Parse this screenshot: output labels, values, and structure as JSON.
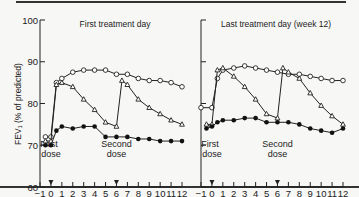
{
  "chart_data": [
    {
      "type": "line",
      "title": "First treatment day",
      "xlabel": "Hours",
      "ylabel": "FEV1 (% of predicted)",
      "xlim": [
        -1,
        12
      ],
      "ylim": [
        60,
        100
      ],
      "xticks": [
        -1,
        0,
        1,
        2,
        3,
        4,
        5,
        6,
        7,
        8,
        9,
        10,
        11,
        12
      ],
      "yticks": [
        60,
        70,
        80,
        90,
        100
      ],
      "annotations": [
        {
          "text": "First dose",
          "x": 0
        },
        {
          "text": "Second dose",
          "x": 6
        }
      ],
      "series": [
        {
          "name": "open-circle",
          "marker": "open-circle",
          "x": [
            -0.5,
            0,
            0.5,
            1,
            2,
            3,
            4,
            5,
            6,
            7,
            8,
            9,
            10,
            11,
            12
          ],
          "values": [
            72,
            72,
            85,
            86,
            87.5,
            88,
            88,
            88,
            87,
            87,
            86,
            85.5,
            85.5,
            85,
            84
          ]
        },
        {
          "name": "open-triangle",
          "marker": "open-triangle",
          "x": [
            -0.5,
            0,
            0.5,
            1,
            2,
            3,
            4,
            5,
            6,
            6.5,
            7,
            8,
            9,
            10,
            11,
            12
          ],
          "values": [
            71,
            71,
            84.5,
            85,
            84,
            81,
            78.5,
            75.5,
            74.5,
            85.5,
            84.5,
            81,
            79,
            77.5,
            76,
            75
          ]
        },
        {
          "name": "filled-circle",
          "marker": "filled-circle",
          "x": [
            -0.5,
            0,
            0.5,
            1,
            2,
            3,
            4,
            5,
            6,
            7,
            8,
            9,
            10,
            11,
            12
          ],
          "values": [
            70,
            70,
            73.5,
            74.5,
            74,
            74.5,
            74.5,
            72,
            72,
            72,
            71.5,
            71.5,
            71,
            71,
            71
          ]
        }
      ]
    },
    {
      "type": "line",
      "title": "Last treatment day (week 12)",
      "xlabel": "Hours",
      "ylabel": "FEV1 (% of predicted)",
      "xlim": [
        -1,
        12
      ],
      "ylim": [
        60,
        100
      ],
      "xticks": [
        -1,
        0,
        1,
        2,
        3,
        4,
        5,
        6,
        7,
        8,
        9,
        10,
        11,
        12
      ],
      "yticks": [
        60,
        70,
        80,
        90,
        100
      ],
      "annotations": [
        {
          "text": "First dose",
          "x": 0
        },
        {
          "text": "Second dose",
          "x": 6
        }
      ],
      "series": [
        {
          "name": "open-circle",
          "marker": "open-circle",
          "x": [
            -1,
            0,
            0.5,
            1,
            2,
            3,
            4,
            5,
            6,
            7,
            8,
            9,
            10,
            11,
            12
          ],
          "values": [
            79,
            79,
            86,
            88,
            88.5,
            89,
            88.5,
            88,
            87.5,
            87,
            87,
            86.5,
            86,
            85.5,
            85.5
          ]
        },
        {
          "name": "open-triangle",
          "marker": "open-triangle",
          "x": [
            -0.5,
            0,
            0.5,
            1,
            2,
            3,
            4,
            5,
            6,
            6.5,
            7,
            8,
            9,
            10,
            11,
            12
          ],
          "values": [
            75,
            75,
            88,
            88.5,
            86.5,
            84,
            81,
            77.5,
            76.5,
            88.5,
            87.5,
            86,
            82.5,
            79.5,
            77,
            75
          ]
        },
        {
          "name": "filled-circle",
          "marker": "filled-circle",
          "x": [
            -0.5,
            0,
            0.5,
            1,
            2,
            3,
            4,
            5,
            6,
            7,
            8,
            9,
            10,
            11,
            12
          ],
          "values": [
            74,
            74.5,
            75.5,
            76,
            76,
            76.5,
            76.5,
            75.5,
            75.5,
            75.5,
            75,
            74,
            73.5,
            73,
            74
          ]
        }
      ]
    }
  ],
  "labels": {
    "left_title": "First treatment day",
    "right_title": "Last treatment day (week 12)",
    "ylabel": "FEV₁ (% of predicted)",
    "xlabel": "Hours",
    "first_dose_1": "First",
    "first_dose_2": "dose",
    "second_dose_1": "Second",
    "second_dose_2": "dose"
  }
}
